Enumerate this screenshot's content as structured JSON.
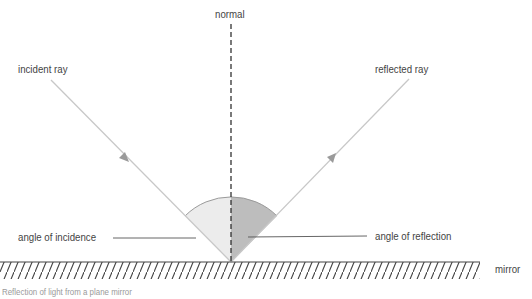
{
  "diagram": {
    "title": "Reflection of light",
    "labels": {
      "normal": "normal",
      "incident_ray": "incident ray",
      "reflected_ray": "reflected ray",
      "angle_of_incidence": "angle of incidence",
      "angle_of_reflection": "angle of reflection",
      "mirror": "mirror"
    },
    "caption": "Reflection of light from a plane mirror",
    "colors": {
      "ray": "#c8c8c8",
      "normal_line": "#222222",
      "incidence_sector": "#ececec",
      "reflection_sector": "#bdbdbd",
      "arc": "#9a9a9a",
      "leader_line": "#555555",
      "mirror_hatch": "#444444",
      "text": "#444444"
    }
  }
}
